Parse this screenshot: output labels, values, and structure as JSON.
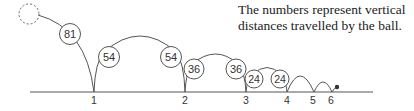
{
  "caption": {
    "line1": "The numbers represent vertical",
    "line2": "distances travelled by the ball."
  },
  "labels": {
    "drops": [
      "81",
      "54",
      "54",
      "36",
      "36",
      "24",
      "24"
    ],
    "bounces": [
      "1",
      "2",
      "3",
      "4",
      "5",
      "6"
    ]
  },
  "colors": {
    "stroke": "#555555",
    "text": "#333333",
    "ball": "#333333"
  }
}
